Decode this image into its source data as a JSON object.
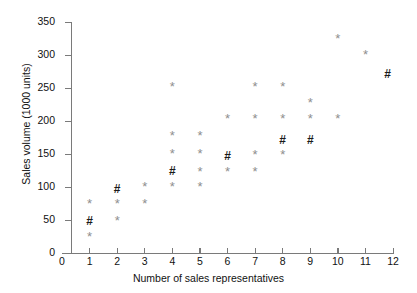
{
  "chart_data": {
    "type": "scatter",
    "title": "",
    "xlabel": "Number of sales representatives",
    "ylabel": "Sales volume (1000 units)",
    "xlim": [
      0,
      12
    ],
    "ylim": [
      0,
      350
    ],
    "xticks": [
      0,
      1,
      2,
      3,
      4,
      5,
      6,
      7,
      8,
      9,
      10,
      11,
      12
    ],
    "yticks": [
      0,
      50,
      100,
      150,
      200,
      250,
      300,
      350
    ],
    "grid": false,
    "legend": "none",
    "marker_colors": {
      "star": "#8e8e8e",
      "hash": "#1a1a1a"
    },
    "series": [
      {
        "name": "star",
        "marker": "*",
        "points": [
          [
            1,
            25
          ],
          [
            1,
            75
          ],
          [
            2,
            48
          ],
          [
            2,
            75
          ],
          [
            3,
            75
          ],
          [
            3,
            100
          ],
          [
            4,
            100
          ],
          [
            4,
            150
          ],
          [
            4,
            177
          ],
          [
            4,
            252
          ],
          [
            5,
            100
          ],
          [
            5,
            123
          ],
          [
            5,
            150
          ],
          [
            5,
            177
          ],
          [
            6,
            123
          ],
          [
            6,
            203
          ],
          [
            7,
            123
          ],
          [
            7,
            148
          ],
          [
            7,
            203
          ],
          [
            7,
            252
          ],
          [
            8,
            148
          ],
          [
            8,
            203
          ],
          [
            8,
            252
          ],
          [
            9,
            203
          ],
          [
            9,
            227
          ],
          [
            10,
            203
          ],
          [
            10,
            325
          ],
          [
            11,
            300
          ]
        ]
      },
      {
        "name": "hash",
        "marker": "#",
        "points": [
          [
            1,
            47
          ],
          [
            2,
            95
          ],
          [
            4,
            123
          ],
          [
            6,
            145
          ],
          [
            8,
            170
          ],
          [
            9,
            170
          ],
          [
            11.8,
            270
          ]
        ]
      }
    ]
  },
  "axis": {
    "x_title": "Number of sales representatives",
    "y_title": "Sales volume (1000 units)",
    "x_tick_labels": [
      "0",
      "1",
      "2",
      "3",
      "4",
      "5",
      "6",
      "7",
      "8",
      "9",
      "10",
      "11",
      "12"
    ],
    "y_tick_labels": [
      "0",
      "50",
      "100",
      "150",
      "200",
      "250",
      "300",
      "350"
    ]
  }
}
